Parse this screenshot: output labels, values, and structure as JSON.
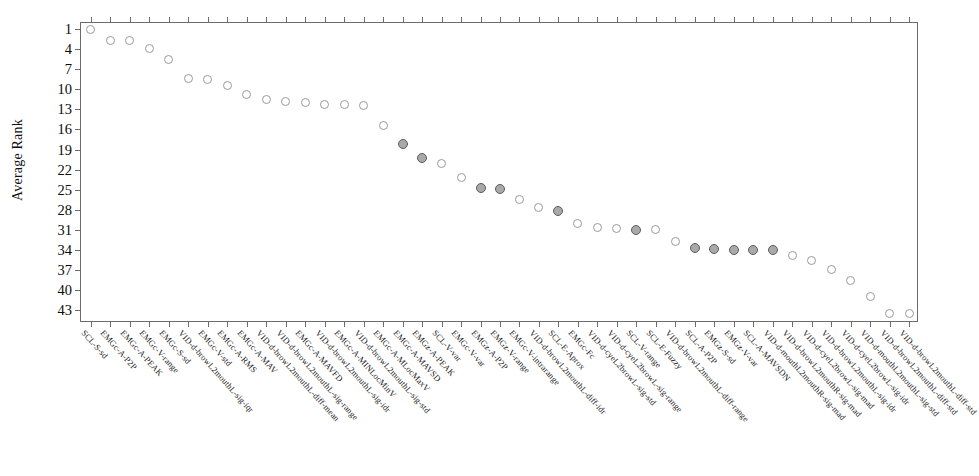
{
  "chart_data": {
    "type": "scatter",
    "title": "",
    "xlabel": "",
    "ylabel": "Average Rank",
    "ylim": [
      1,
      44
    ],
    "y_inverted": true,
    "grid": false,
    "legend": "none",
    "yticks": [
      1,
      4,
      7,
      10,
      13,
      16,
      19,
      22,
      25,
      28,
      31,
      34,
      37,
      40,
      43
    ],
    "categories": [
      "SCL-S-sd",
      "EMGc-A-P2P",
      "EMGc-A-PEAK",
      "EMGc-V-range",
      "EMGc-S-sd",
      "VID-d-browL2mouthL-sig-iqr",
      "EMGc-V-std",
      "EMGc-A-RMS",
      "EMGc-A-MAV",
      "VID-d-browL2mouthL-diff-mean",
      "VID-d-browL2mouthL-sig-range",
      "EMGc-A-MAVFD",
      "VID-d-browL2mouthL-sig-idr",
      "EMGc-A-MINLocMinV",
      "VID-d-browL2mouthL-sig-std",
      "EMGc-A-MLocMaxV",
      "EMGc-A-MAVSD",
      "EMGz-A-PEAK",
      "SCL-V-var",
      "EMGc-V-var",
      "EMGz-A-P2P",
      "EMGz-V-range",
      "EMGc-V-intrarange",
      "VID-d-browL2mouthL-diff-idr",
      "SCL-E-Aprox",
      "EMGc-Fc",
      "VID-d-cyeL2browL-sig-std",
      "VID-d-cyeL2browL-sig-range",
      "SCL-V-range",
      "SCL-E-Fuzzy",
      "VID-d-browL2mouthL-diff-range",
      "SCL-A-P2P",
      "EMGz-S-sd",
      "EMGz-V-var",
      "SCL-A-MAVSDN",
      "VID-d-mouthL2mouthR-sig-mad",
      "VID-d-browL2mouthR-sig-mad",
      "VID-d-cyeL2browL-sig-mad",
      "VID-d-browL2mouthL-sig-idr",
      "VID-d-cyeL2browL-sig-idr",
      "VID-d-mouthL2mouthL-sig-std",
      "VID-d-browL2mouthL-diff-std",
      "VID-d-browL2mouthL-diff-std2"
    ],
    "values": [
      1.0,
      2.7,
      2.7,
      3.9,
      5.6,
      8.4,
      8.6,
      9.4,
      10.8,
      11.6,
      11.8,
      11.9,
      12.2,
      12.3,
      12.4,
      15.4,
      18.1,
      20.3,
      21.1,
      23.2,
      24.8,
      24.9,
      26.5,
      27.7,
      28.2,
      30.1,
      30.7,
      30.8,
      31.0,
      31.0,
      32.8,
      33.7,
      33.9,
      34.0,
      34.0,
      34.0,
      34.8,
      35.6,
      36.9,
      38.6,
      41.0,
      43.5,
      43.5
    ],
    "selected_indices": [
      16,
      17,
      20,
      21,
      24,
      28,
      31,
      32,
      33,
      34,
      35
    ],
    "marker": {
      "shape": "circle-open",
      "default_edge": "#9a9a9a",
      "default_fill": "#ffffff",
      "selected_edge": "#5d5d5d",
      "selected_fill": "#a9a9a9"
    },
    "colors": {
      "axis": "#6b6b6b",
      "text": "#101010",
      "background": "#ffffff"
    }
  }
}
